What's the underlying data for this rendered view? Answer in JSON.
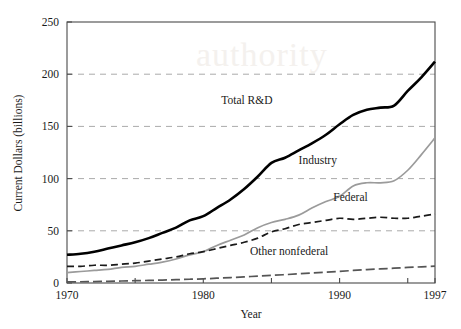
{
  "chart_data": {
    "type": "line",
    "title": "",
    "xlabel": "Year",
    "ylabel": "Current Dollars (billions)",
    "xlim": [
      1970,
      1997
    ],
    "ylim": [
      0,
      250
    ],
    "xticks": [
      1970,
      1975,
      1980,
      1985,
      1990,
      1995,
      1997
    ],
    "xtick_labels": [
      "1970",
      "",
      "1980",
      "",
      "1990",
      "",
      "1997"
    ],
    "yticks": [
      0,
      50,
      100,
      150,
      200,
      250
    ],
    "ytick_labels": [
      "0",
      "50",
      "100",
      "150",
      "200",
      "250"
    ],
    "grid": "horizontal-dashed",
    "gridlines": [
      50,
      100,
      150,
      200
    ],
    "legend_position": "inline-annotations",
    "watermark_text": "authority",
    "x": [
      1970,
      1971,
      1972,
      1973,
      1974,
      1975,
      1976,
      1977,
      1978,
      1979,
      1980,
      1981,
      1982,
      1983,
      1984,
      1985,
      1986,
      1987,
      1988,
      1989,
      1990,
      1991,
      1992,
      1993,
      1994,
      1995,
      1996,
      1997
    ],
    "series": [
      {
        "name": "Total R&D",
        "style": "solid-black-thick",
        "color": "#000000",
        "label_x": 1983.2,
        "label_y": 171,
        "values": [
          27,
          28,
          30,
          33,
          36,
          39,
          43,
          48,
          53,
          60,
          64,
          72,
          80,
          90,
          102,
          115,
          120,
          127,
          134,
          142,
          152,
          161,
          166,
          168,
          170,
          184,
          197,
          212
        ]
      },
      {
        "name": "Industry",
        "style": "solid-gray",
        "color": "#9b9b9b",
        "label_x": 1988.4,
        "label_y": 114,
        "values": [
          10,
          11,
          12,
          13,
          15,
          16,
          18,
          20,
          23,
          27,
          30,
          36,
          41,
          46,
          53,
          58,
          61,
          65,
          72,
          78,
          83,
          93,
          96,
          96,
          98,
          108,
          123,
          139
        ]
      },
      {
        "name": "Federal",
        "style": "dashed-black",
        "color": "#1a1a1a",
        "label_x": 1990.8,
        "label_y": 79,
        "values": [
          16,
          16,
          17,
          17,
          18,
          19,
          21,
          23,
          25,
          28,
          30,
          33,
          36,
          39,
          43,
          49,
          52,
          56,
          58,
          60,
          62,
          61,
          62,
          63,
          62,
          62,
          64,
          66
        ]
      },
      {
        "name": "Other nonfederal",
        "style": "dash-dot-gray",
        "color": "#555555",
        "label_x": 1986.3,
        "label_y": 27,
        "values": [
          1.0,
          1.2,
          1.4,
          1.6,
          1.9,
          2.2,
          2.5,
          2.8,
          3.2,
          3.6,
          4.0,
          4.6,
          5.2,
          5.9,
          6.6,
          7.3,
          8.0,
          8.8,
          9.6,
          10.4,
          11.2,
          12.0,
          12.8,
          13.5,
          14.2,
          14.9,
          15.5,
          16.2
        ]
      }
    ]
  },
  "axes": {
    "y_title": "Current Dollars (billions)",
    "x_title": "Year"
  }
}
